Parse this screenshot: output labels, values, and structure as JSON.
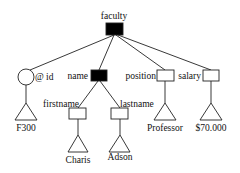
{
  "diagram": {
    "type": "xml-tree",
    "colors": {
      "element_filled": "#000000",
      "element_empty": "#ffffff",
      "stroke": "#222222",
      "text": "#111111"
    },
    "nodes": {
      "root": {
        "label": "faculty",
        "kind": "element",
        "filled": true
      },
      "id_attr": {
        "label": "@ id",
        "kind": "attribute"
      },
      "name": {
        "label": "name",
        "kind": "element",
        "filled": true
      },
      "position": {
        "label": "position",
        "kind": "element",
        "filled": false
      },
      "salary": {
        "label": "salary",
        "kind": "element",
        "filled": false
      },
      "firstname": {
        "label": "firstname",
        "kind": "element",
        "filled": false
      },
      "lastname": {
        "label": "lastname",
        "kind": "element",
        "filled": false
      },
      "id_value": {
        "label": "F300",
        "kind": "value"
      },
      "firstname_value": {
        "label": "Charis",
        "kind": "value"
      },
      "lastname_value": {
        "label": "Adson",
        "kind": "value"
      },
      "position_value": {
        "label": "Professor",
        "kind": "value"
      },
      "salary_value": {
        "label": "$70.000",
        "kind": "value"
      }
    },
    "edges": [
      [
        "faculty",
        "@ id"
      ],
      [
        "faculty",
        "name"
      ],
      [
        "faculty",
        "position"
      ],
      [
        "faculty",
        "salary"
      ],
      [
        "name",
        "firstname"
      ],
      [
        "name",
        "lastname"
      ],
      [
        "@ id",
        "F300"
      ],
      [
        "firstname",
        "Charis"
      ],
      [
        "lastname",
        "Adson"
      ],
      [
        "position",
        "Professor"
      ],
      [
        "salary",
        "$70.000"
      ]
    ]
  }
}
